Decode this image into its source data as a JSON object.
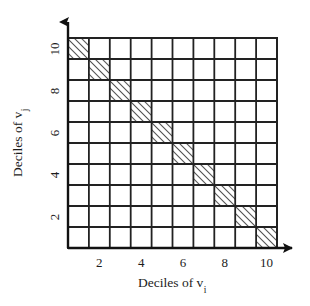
{
  "figure": {
    "name": "deciles-scatter-grid",
    "background_color": "#ffffff",
    "line_color": "#222222",
    "hatch_color": "#2b2b2b"
  },
  "axes": {
    "x": {
      "title_text": "Deciles of v",
      "title_subscript": "i",
      "tick_labels": [
        "2",
        "4",
        "6",
        "8",
        "10"
      ],
      "tick_positions": [
        2,
        4,
        6,
        8,
        10
      ],
      "arrow": "arrow-right"
    },
    "y": {
      "title_text": "Deciles of v",
      "title_subscript": "j",
      "tick_labels": [
        "10",
        "8",
        "6",
        "4",
        "2"
      ],
      "tick_positions": [
        10,
        8,
        6,
        4,
        2
      ],
      "arrow": "arrow-up"
    }
  },
  "chart_data": {
    "type": "heatmap",
    "title": "",
    "xlabel": "Deciles of v_i",
    "ylabel": "Deciles of v_j",
    "xlim": [
      0,
      10
    ],
    "ylim": [
      0,
      10
    ],
    "grid": true,
    "legend": false,
    "rows": 10,
    "cols": 10,
    "x_tick_labels": [
      "2",
      "4",
      "6",
      "8",
      "10"
    ],
    "y_tick_labels": [
      "2",
      "4",
      "6",
      "8",
      "10"
    ],
    "cell_fill_default": "none",
    "cell_fill_highlight": "hatch-diagonal-up",
    "highlighted_cells": [
      {
        "x": 1,
        "y": 10
      },
      {
        "x": 2,
        "y": 9
      },
      {
        "x": 3,
        "y": 8
      },
      {
        "x": 4,
        "y": 7
      },
      {
        "x": 5,
        "y": 6
      },
      {
        "x": 6,
        "y": 5
      },
      {
        "x": 7,
        "y": 4
      },
      {
        "x": 8,
        "y": 3
      },
      {
        "x": 9,
        "y": 2
      },
      {
        "x": 10,
        "y": 1
      }
    ],
    "values": [
      [
        1,
        0,
        0,
        0,
        0,
        0,
        0,
        0,
        0,
        0
      ],
      [
        0,
        1,
        0,
        0,
        0,
        0,
        0,
        0,
        0,
        0
      ],
      [
        0,
        0,
        1,
        0,
        0,
        0,
        0,
        0,
        0,
        0
      ],
      [
        0,
        0,
        0,
        1,
        0,
        0,
        0,
        0,
        0,
        0
      ],
      [
        0,
        0,
        0,
        0,
        1,
        0,
        0,
        0,
        0,
        0
      ],
      [
        0,
        0,
        0,
        0,
        0,
        1,
        0,
        0,
        0,
        0
      ],
      [
        0,
        0,
        0,
        0,
        0,
        0,
        1,
        0,
        0,
        0
      ],
      [
        0,
        0,
        0,
        0,
        0,
        0,
        0,
        1,
        0,
        0
      ],
      [
        0,
        0,
        0,
        0,
        0,
        0,
        0,
        0,
        1,
        0
      ],
      [
        0,
        0,
        0,
        0,
        0,
        0,
        0,
        0,
        0,
        1
      ]
    ]
  }
}
